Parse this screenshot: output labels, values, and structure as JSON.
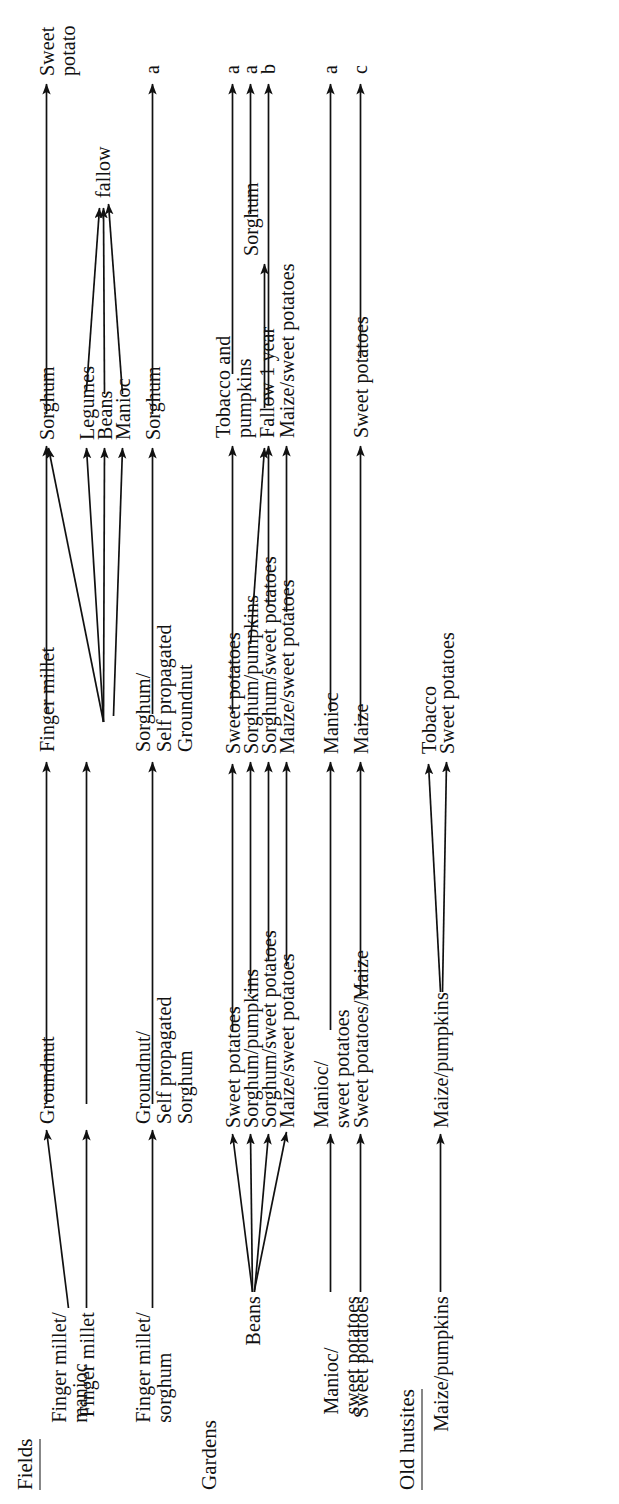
{
  "diagram": {
    "type": "crop-rotation-flow",
    "orientation": "rotated-90ccw",
    "sections": [
      {
        "id": "fields",
        "title": "Fields",
        "underlined": true
      },
      {
        "id": "gardens",
        "title": "Gardens",
        "underlined": false
      },
      {
        "id": "hutsites",
        "title": "Old hutsites",
        "underlined": true
      }
    ],
    "rows": [
      {
        "id": "f1",
        "section": "fields",
        "stages": [
          "Finger millet/\nmanioc",
          "Groundnut",
          "Finger millet",
          "Sorghum",
          "Sweet\npotato"
        ],
        "end_tag": "a"
      },
      {
        "id": "f2",
        "section": "fields",
        "stages": [
          "Finger millet",
          "Groundnut",
          "Finger millet",
          "Legumes",
          "fallow"
        ],
        "end_tag": ""
      },
      {
        "id": "f3",
        "section": "fields",
        "stages": [
          "",
          "",
          "",
          "Beans",
          "fallow"
        ],
        "end_tag": ""
      },
      {
        "id": "f4",
        "section": "fields",
        "stages": [
          "",
          "",
          "",
          "Manioc",
          "fallow"
        ],
        "end_tag": ""
      },
      {
        "id": "f5",
        "section": "fields",
        "stages": [
          "Finger millet/\nsorghum",
          "Groundnut/\nSelf propagated\nSorghum",
          "Sorghum/\nSelf propagated\nGroundnut",
          "Sorghum",
          ""
        ],
        "end_tag": "a"
      },
      {
        "id": "g1",
        "section": "gardens",
        "stages": [
          "Beans",
          "Sweet potatoes",
          "Sweet potatoes",
          "Tobacco and\npumpkins",
          ""
        ],
        "end_tag": "a"
      },
      {
        "id": "g2",
        "section": "gardens",
        "stages": [
          "Beans",
          "Sorghum/pumpkins",
          "Sorghum/pumpkins",
          "Fallow 1 year",
          "Sorghum"
        ],
        "end_tag": "a"
      },
      {
        "id": "g3",
        "section": "gardens",
        "stages": [
          "Beans",
          "Sorghum/sweet potatoes",
          "Sorghum/sweet potatoes",
          "Fallow 1 year",
          ""
        ],
        "end_tag": "b"
      },
      {
        "id": "g4",
        "section": "gardens",
        "stages": [
          "Beans",
          "Maize/sweet potatoes",
          "Maize/sweet potatoes",
          "Maize/sweet potatoes",
          ""
        ],
        "end_tag": ""
      },
      {
        "id": "g5",
        "section": "gardens",
        "stages": [
          "Manioc/\nsweet potatoes",
          "Manioc/\nsweet potatoes",
          "Manioc",
          "",
          ""
        ],
        "end_tag": "a"
      },
      {
        "id": "g6",
        "section": "gardens",
        "stages": [
          "Sweet potatoes",
          "Sweet potatoes/Maize",
          "Maize",
          "Sweet potatoes",
          ""
        ],
        "end_tag": "c"
      },
      {
        "id": "h1",
        "section": "hutsites",
        "stages": [
          "Maize/pumpkins",
          "Maize/pumpkins",
          "Tobacco",
          "",
          ""
        ],
        "end_tag": ""
      },
      {
        "id": "h2",
        "section": "hutsites",
        "stages": [
          "Maize/pumpkins",
          "Maize/pumpkins",
          "Sweet potatoes",
          "",
          ""
        ],
        "end_tag": ""
      }
    ],
    "end_tags": [
      "a",
      "b",
      "c"
    ],
    "labels": {
      "fields": "Fields",
      "gardens": "Gardens",
      "hutsites": "Old hutsites",
      "finger_millet_manioc": "Finger millet/\nmanioc",
      "finger_millet": "Finger millet",
      "finger_millet_sorghum": "Finger millet/\nsorghum",
      "groundnut": "Groundnut",
      "groundnut_self_sorghum": "Groundnut/\nSelf propagated\nSorghum",
      "sorghum_self_groundnut": "Sorghum/\nSelf propagated\nGroundnut",
      "sorghum": "Sorghum",
      "sweet_potato": "Sweet\npotato",
      "legumes": "Legumes",
      "beans": "Beans",
      "manioc": "Manioc",
      "fallow": "fallow",
      "sweet_potatoes": "Sweet potatoes",
      "sorghum_pumpkins": "Sorghum/pumpkins",
      "sorghum_sweet_potatoes": "Sorghum/sweet potatoes",
      "maize_sweet_potatoes": "Maize/sweet potatoes",
      "manioc_sweet_potatoes": "Manioc/\nsweet potatoes",
      "sweet_potatoes_maize": "Sweet potatoes/Maize",
      "maize": "Maize",
      "tobacco_and_pumpkins": "Tobacco and\npumpkins",
      "fallow_1_year": "Fallow 1 year",
      "tobacco": "Tobacco",
      "maize_pumpkins": "Maize/pumpkins",
      "tag_a": "a",
      "tag_b": "b",
      "tag_c": "c"
    },
    "colors": {
      "ink": "#111111",
      "background": "#ffffff"
    }
  }
}
